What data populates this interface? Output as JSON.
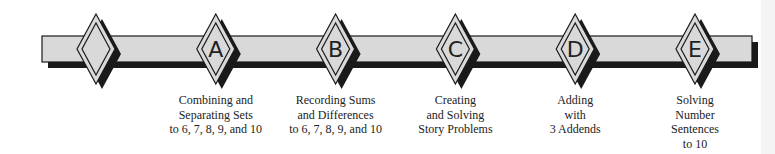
{
  "diagram": {
    "type": "timeline",
    "colors": {
      "bar_fill": "#d9d9d9",
      "stroke": "#1a1a1a",
      "shadow": "#1a1a1a",
      "background": "#ffffff"
    },
    "markers": [
      {
        "letter": "",
        "lines": []
      },
      {
        "letter": "A",
        "lines": [
          "Combining and",
          "Separating Sets",
          "to 6, 7, 8, 9, and 10"
        ]
      },
      {
        "letter": "B",
        "lines": [
          "Recording Sums",
          "and Differences",
          "to 6, 7, 8, 9, and 10"
        ]
      },
      {
        "letter": "C",
        "lines": [
          "Creating",
          "and Solving",
          "Story Problems"
        ]
      },
      {
        "letter": "D",
        "lines": [
          "Adding",
          "with",
          "3 Addends"
        ]
      },
      {
        "letter": "E",
        "lines": [
          "Solving",
          "Number",
          "Sentences",
          "to 10"
        ]
      }
    ]
  }
}
